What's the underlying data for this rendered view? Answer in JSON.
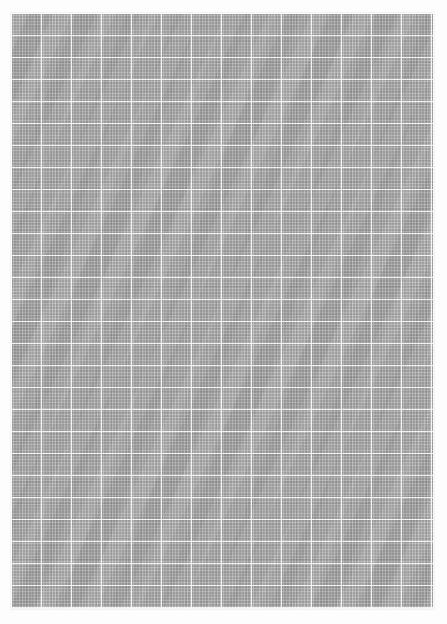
{
  "page": {
    "kind": "texture-image",
    "width_px": 447,
    "height_px": 624,
    "background_color": "#fdfdfd",
    "has_text": false,
    "has_controls": false
  },
  "sheet": {
    "label": "grid-paper-sheet",
    "fill_color": "#9c9c9c",
    "left_px": 11,
    "top_px": 13,
    "width_px": 423,
    "height_px": 596,
    "frame_color": "#f2f2f2"
  },
  "grid": {
    "minor": {
      "label": "minor-grid",
      "pitch_px": 3,
      "line_color": "#ffffff",
      "opacity": 0.24
    },
    "major_vertical": {
      "label": "major-vertical-rules",
      "pitch_px": 30,
      "line_color": "#ffffff",
      "opacity": 0.88
    },
    "major_horizontal": {
      "label": "major-horizontal-rules",
      "pitch_px": 22,
      "line_color": "#ffffff",
      "opacity": 0.85
    },
    "weave": {
      "label": "fabric-weave-noise",
      "dark_color": "#000000",
      "light_color": "#ffffff"
    }
  },
  "margins": {
    "left_px": 11,
    "right_px": 13,
    "top_px": 13,
    "bottom_px": 15,
    "color": "#ffffff"
  }
}
